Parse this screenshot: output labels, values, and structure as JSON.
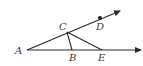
{
  "figure": {
    "colors": {
      "stroke": "#2a2a2a",
      "label": "#3a3a3a",
      "background": "#ffffff"
    },
    "points": {
      "A": {
        "label": "A",
        "x": 27,
        "y": 50,
        "label_x": 15,
        "label_y": 54
      },
      "B": {
        "label": "B",
        "x": 72,
        "y": 50,
        "label_x": 69,
        "label_y": 61
      },
      "C": {
        "label": "C",
        "x": 67,
        "y": 32,
        "label_x": 59,
        "label_y": 30
      },
      "D": {
        "label": "D",
        "x": 100,
        "y": 18,
        "label_x": 96,
        "label_y": 30
      },
      "E": {
        "label": "E",
        "x": 102,
        "y": 50,
        "label_x": 98,
        "label_y": 61
      }
    },
    "rays": [
      {
        "name": "ray-ACD",
        "from": "A",
        "through": [
          "C",
          "D"
        ],
        "end_x": 120,
        "end_y": 11
      },
      {
        "name": "ray-ABE",
        "from": "A",
        "through": [
          "B",
          "E"
        ],
        "end_x": 141,
        "end_y": 50
      }
    ],
    "segments": [
      {
        "name": "segment-CB",
        "from": "C",
        "to": "B"
      },
      {
        "name": "segment-CE",
        "from": "C",
        "to": "E"
      }
    ],
    "marked_points": [
      "D"
    ]
  }
}
